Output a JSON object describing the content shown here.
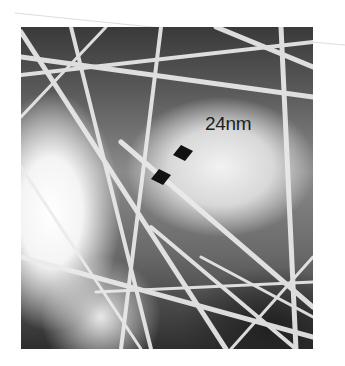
{
  "figure": {
    "type": "micrograph",
    "scale_label": "24nm",
    "markers": [
      "arrow-marker-top",
      "arrow-marker-bottom"
    ],
    "colors": {
      "background": "#ffffff",
      "fiber": "#e6e6e6",
      "dark_region": "#2a2a2a",
      "label_text": "#1e1e1e"
    }
  }
}
